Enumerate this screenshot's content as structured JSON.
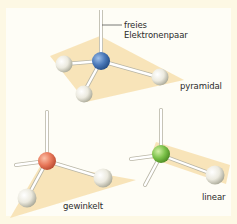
{
  "figure": {
    "background_color": "#fdf8e4",
    "panel_color": "#fefdf6",
    "plane_color": "#f7dfae",
    "ligand_color": "#e9e8de",
    "bond_color": "#ffffff"
  },
  "molecules": [
    {
      "id": "pyramidal",
      "label": "pyramidal",
      "central_atom_color": "#4a78b8",
      "ligands": 3,
      "lone_pairs": 1,
      "annotation": {
        "line1": "freies",
        "line2": "Elektronenpaar"
      }
    },
    {
      "id": "gewinkelt",
      "label": "gewinkelt",
      "central_atom_color": "#e8785a",
      "ligands": 2,
      "lone_pairs": 2
    },
    {
      "id": "linear",
      "label": "linear",
      "central_atom_color": "#7cc24a",
      "ligands": 1,
      "lone_pairs": 3
    }
  ]
}
